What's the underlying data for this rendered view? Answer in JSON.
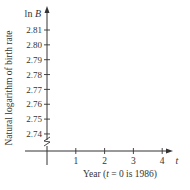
{
  "chart_data": {
    "type": "line",
    "title": "",
    "xlabel": "Year (t = 0 is 1986)",
    "xlabel_parts": {
      "pre": "Year (",
      "var": "t",
      "post": " = 0 is 1986)"
    },
    "ylabel": "Natural logarithm of birth rate",
    "y_axis_symbol": {
      "fn": "ln ",
      "var": "B"
    },
    "x_axis_symbol": "t",
    "x_ticks": [
      "1",
      "2",
      "3",
      "4"
    ],
    "x_tick_values": [
      1,
      2,
      3,
      4
    ],
    "y_ticks": [
      "2.81",
      "2.80",
      "2.79",
      "2.78",
      "2.77",
      "2.76",
      "2.75",
      "2.74"
    ],
    "y_tick_values": [
      2.81,
      2.8,
      2.79,
      2.78,
      2.77,
      2.76,
      2.75,
      2.74
    ],
    "xlim": [
      0,
      4.5
    ],
    "ylim": [
      2.73,
      2.82
    ],
    "y_axis_break": true,
    "grid": false,
    "legend": null,
    "series": []
  },
  "colors": {
    "axis": "#333333",
    "text": "#333333",
    "background": "#ffffff"
  }
}
